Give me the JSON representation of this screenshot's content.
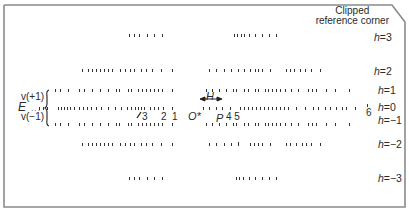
{
  "diagram": {
    "corner_label_line1": "Clipped",
    "corner_label_line2": "reference corner",
    "row_labels": [
      {
        "h": "3",
        "text": "=3",
        "y": 37
      },
      {
        "h": "2",
        "text": "=2",
        "y": 71
      },
      {
        "h": "1",
        "text": "=1",
        "y": 90
      },
      {
        "h": "0",
        "text": "=0",
        "y": 103
      },
      {
        "h": "-1",
        "text": "=−1",
        "y": 116
      },
      {
        "h": "-2",
        "text": "=−2",
        "y": 140
      },
      {
        "h": "-3",
        "text": "=−3",
        "y": 174
      }
    ],
    "h_symbol": "h",
    "left_labels": {
      "v_plus": "v(+1)",
      "E": "E",
      "v_minus": "v(−1)"
    },
    "markers": {
      "slash3": "/3",
      "two": "2",
      "one": "1",
      "origin": "O*",
      "H": "H",
      "P": "P",
      "four_five": "4 5",
      "six": "6"
    },
    "colors": {
      "border": "#8a8a8a",
      "dots": "#333333",
      "text": "#2a2a2a"
    }
  }
}
